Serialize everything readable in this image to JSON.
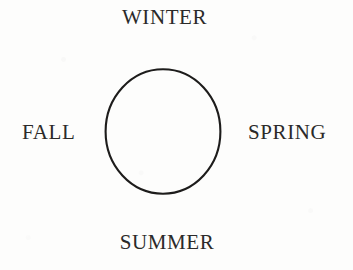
{
  "diagram": {
    "shape": "circle",
    "stroke_color": "#1d1c1b",
    "text_color": "#2b2a29",
    "background_color": "#fdfdfc",
    "labels": {
      "top": "WINTER",
      "right": "SPRING",
      "bottom": "SUMMER",
      "left": "FALL"
    }
  }
}
